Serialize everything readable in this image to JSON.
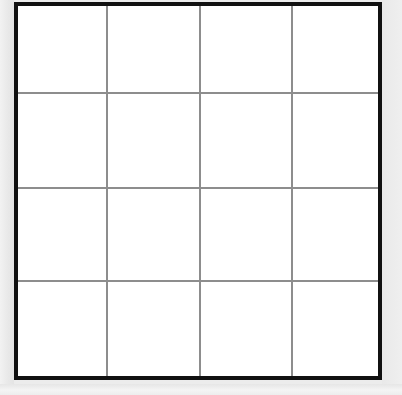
{
  "figure": {
    "title": "",
    "type": "grid",
    "canvas": {
      "width": 402,
      "height": 395,
      "background_color": "#ececec"
    },
    "grid_box": {
      "left": 14,
      "top": 2,
      "width": 368,
      "height": 378,
      "border_color": "#111111",
      "border_width": 4,
      "fill_color": "#ffffff"
    },
    "grid": {
      "rows": 4,
      "columns": 4,
      "cell_count": 16,
      "line_color": "#8d8d8d",
      "line_width": 2,
      "line_style": "solid",
      "vertical_line_positions": [
        88,
        181,
        273
      ],
      "horizontal_line_positions": [
        86,
        181,
        274
      ]
    },
    "cells": [
      {
        "row": 1,
        "column": 1,
        "label": "",
        "fill": "#ffffff"
      },
      {
        "row": 1,
        "column": 2,
        "label": "",
        "fill": "#ffffff"
      },
      {
        "row": 1,
        "column": 3,
        "label": "",
        "fill": "#ffffff"
      },
      {
        "row": 1,
        "column": 4,
        "label": "",
        "fill": "#ffffff"
      },
      {
        "row": 2,
        "column": 1,
        "label": "",
        "fill": "#ffffff"
      },
      {
        "row": 2,
        "column": 2,
        "label": "",
        "fill": "#ffffff"
      },
      {
        "row": 2,
        "column": 3,
        "label": "",
        "fill": "#ffffff"
      },
      {
        "row": 2,
        "column": 4,
        "label": "",
        "fill": "#ffffff"
      },
      {
        "row": 3,
        "column": 1,
        "label": "",
        "fill": "#ffffff"
      },
      {
        "row": 3,
        "column": 2,
        "label": "",
        "fill": "#ffffff"
      },
      {
        "row": 3,
        "column": 3,
        "label": "",
        "fill": "#ffffff"
      },
      {
        "row": 3,
        "column": 4,
        "label": "",
        "fill": "#ffffff"
      },
      {
        "row": 4,
        "column": 1,
        "label": "",
        "fill": "#ffffff"
      },
      {
        "row": 4,
        "column": 2,
        "label": "",
        "fill": "#ffffff"
      },
      {
        "row": 4,
        "column": 3,
        "label": "",
        "fill": "#ffffff"
      },
      {
        "row": 4,
        "column": 4,
        "label": "",
        "fill": "#ffffff"
      }
    ]
  }
}
